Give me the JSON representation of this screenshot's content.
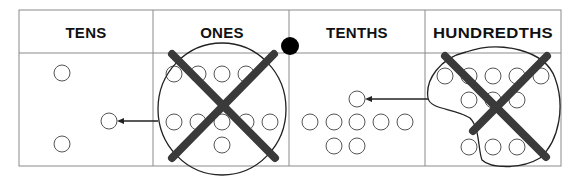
{
  "chart": {
    "columns": [
      {
        "key": "tens",
        "label": "TENS"
      },
      {
        "key": "ones",
        "label": "ONES"
      },
      {
        "key": "tenths",
        "label": "TENTHS"
      },
      {
        "key": "hundredths",
        "label": "HUNDREDTHS"
      }
    ],
    "decimal_point": "between ONES and TENTHS",
    "counters": {
      "tens": 3,
      "ones": 10,
      "tenths": 8,
      "hundredths": 11
    },
    "regroupings": [
      {
        "from": "ones",
        "to": "tens",
        "grouped": 10,
        "crossed_out": true
      },
      {
        "from": "hundredths",
        "to": "tenths",
        "grouped": 10,
        "crossed_out": true
      }
    ],
    "colors": {
      "line": "#333333",
      "grid": "#888888",
      "cross": "#3a3a3a",
      "dot": "#000000"
    }
  }
}
